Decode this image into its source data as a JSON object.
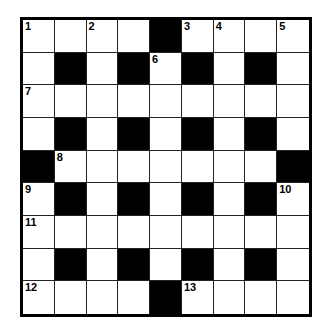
{
  "puzzle": {
    "rows": 9,
    "cols": 9,
    "colors": {
      "block": "#000000",
      "cell": "#ffffff",
      "border": "#000000"
    },
    "grid": [
      "....#....",
      ".#.#.#.#.",
      ".........",
      ".#.#.#.#.",
      "#.......#",
      ".#.#.#.#.",
      ".........",
      ".#.#.#.#.",
      "....#...."
    ],
    "numbers": [
      {
        "row": 0,
        "col": 0,
        "n": "1"
      },
      {
        "row": 0,
        "col": 2,
        "n": "2"
      },
      {
        "row": 0,
        "col": 5,
        "n": "3"
      },
      {
        "row": 0,
        "col": 6,
        "n": "4"
      },
      {
        "row": 0,
        "col": 8,
        "n": "5"
      },
      {
        "row": 1,
        "col": 4,
        "n": "6"
      },
      {
        "row": 2,
        "col": 0,
        "n": "7"
      },
      {
        "row": 4,
        "col": 1,
        "n": "8"
      },
      {
        "row": 5,
        "col": 0,
        "n": "9"
      },
      {
        "row": 5,
        "col": 8,
        "n": "10"
      },
      {
        "row": 6,
        "col": 0,
        "n": "11"
      },
      {
        "row": 8,
        "col": 0,
        "n": "12"
      },
      {
        "row": 8,
        "col": 5,
        "n": "13"
      }
    ]
  }
}
